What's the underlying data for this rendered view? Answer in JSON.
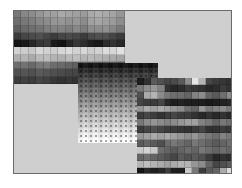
{
  "figure": {
    "frame": {
      "background": "#cfcfcf",
      "border": "#6a6a6a"
    },
    "panels": [
      {
        "name": "panel-top-left-banded-grid",
        "left": 0,
        "top": 0,
        "cols": 15,
        "cell_w": 7.4,
        "cell_h": 7.3,
        "rows": [
          [
            120,
            135,
            140,
            150,
            160,
            160,
            170,
            165,
            160,
            155,
            170,
            175,
            170,
            165,
            150
          ],
          [
            110,
            120,
            125,
            135,
            140,
            150,
            150,
            145,
            150,
            140,
            160,
            165,
            160,
            155,
            140
          ],
          [
            95,
            105,
            110,
            115,
            125,
            130,
            130,
            125,
            135,
            125,
            140,
            140,
            145,
            135,
            120
          ],
          [
            60,
            70,
            75,
            80,
            70,
            60,
            70,
            75,
            70,
            60,
            75,
            80,
            80,
            70,
            60
          ],
          [
            20,
            25,
            40,
            55,
            60,
            25,
            20,
            40,
            55,
            45,
            30,
            25,
            45,
            50,
            40
          ],
          [
            210,
            205,
            200,
            215,
            210,
            205,
            215,
            220,
            210,
            215,
            205,
            210,
            220,
            215,
            225
          ],
          [
            175,
            180,
            170,
            185,
            190,
            180,
            175,
            185,
            190,
            180,
            185,
            180,
            175,
            170,
            165
          ],
          [
            110,
            115,
            105,
            120,
            125,
            110,
            105,
            100,
            95,
            100,
            95,
            90,
            95,
            90,
            85
          ],
          [
            80,
            85,
            80,
            90,
            85,
            80,
            75,
            70,
            70,
            65,
            70,
            65,
            60,
            60,
            55
          ],
          [
            60,
            65,
            60,
            70,
            65,
            55,
            50,
            55,
            50,
            45,
            50,
            45,
            45,
            40,
            40
          ]
        ]
      },
      {
        "name": "panel-middle-gradient-dots",
        "left": 64,
        "top": 52,
        "cols": 16,
        "rows_count": 16,
        "cell_w": 5.0,
        "cell_h": 5.0,
        "gradient_top": 25,
        "gradient_bottom": 250
      },
      {
        "name": "panel-right-mottled-grid",
        "left": 123,
        "top": 67,
        "cols": 14,
        "cell_w": 6.9,
        "cell_h": 6.9,
        "rows": [
          [
            30,
            50,
            90,
            80,
            70,
            75,
            90,
            140,
            230,
            180,
            70,
            60,
            55,
            50
          ],
          [
            120,
            140,
            150,
            130,
            50,
            40,
            45,
            60,
            55,
            50,
            40,
            45,
            60,
            50
          ],
          [
            80,
            170,
            180,
            140,
            120,
            110,
            110,
            100,
            130,
            140,
            100,
            90,
            110,
            140
          ],
          [
            70,
            60,
            60,
            70,
            40,
            30,
            35,
            30,
            30,
            30,
            25,
            30,
            35,
            40
          ],
          [
            150,
            170,
            160,
            170,
            160,
            150,
            140,
            110,
            100,
            150,
            120,
            130,
            140,
            120
          ],
          [
            60,
            70,
            60,
            50,
            60,
            70,
            60,
            60,
            50,
            40,
            50,
            40,
            50,
            40
          ],
          [
            120,
            140,
            150,
            140,
            130,
            140,
            150,
            160,
            160,
            130,
            120,
            100,
            120,
            110
          ],
          [
            60,
            70,
            80,
            70,
            60,
            60,
            55,
            50,
            60,
            70,
            50,
            50,
            60,
            55
          ],
          [
            150,
            160,
            170,
            160,
            170,
            160,
            150,
            140,
            150,
            130,
            120,
            110,
            130,
            120
          ],
          [
            90,
            100,
            90,
            80,
            110,
            120,
            110,
            100,
            120,
            110,
            100,
            90,
            100,
            110
          ],
          [
            200,
            210,
            200,
            110,
            100,
            90,
            100,
            110,
            100,
            120,
            110,
            100,
            110,
            100
          ],
          [
            100,
            110,
            100,
            90,
            80,
            70,
            90,
            80,
            90,
            80,
            60,
            40,
            50,
            45
          ],
          [
            180,
            190,
            180,
            170,
            160,
            170,
            180,
            180,
            150,
            140,
            100,
            70,
            80,
            90
          ],
          [
            20,
            40,
            30,
            40,
            60,
            30,
            30,
            200,
            120,
            60,
            90,
            100,
            170,
            220
          ]
        ]
      }
    ]
  }
}
